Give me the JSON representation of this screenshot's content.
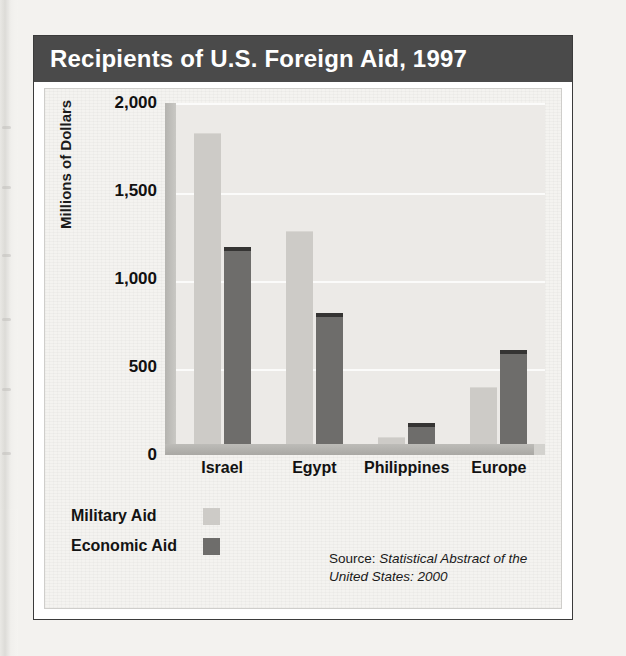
{
  "title": "Recipients of U.S. Foreign Aid, 1997",
  "legend": {
    "military_label": "Military Aid",
    "economic_label": "Economic Aid"
  },
  "source": {
    "prefix": "Source: ",
    "italic": "Statistical Abstract of the United States: 2000"
  },
  "colors": {
    "banner": "#4a4a4a",
    "panel": "#f4f3f0",
    "plot_area": "#eceae7",
    "military_bar": "#cdcbc7",
    "economic_bar": "#6e6d6b",
    "gridline": "#fbfbfa",
    "frame": "#3b3b3b"
  },
  "chart_data": {
    "type": "bar",
    "title": "Recipients of U.S. Foreign Aid, 1997",
    "xlabel": "",
    "ylabel": "Millions of Dollars",
    "categories": [
      "Israel",
      "Egypt",
      "Philippines",
      "Europe"
    ],
    "series": [
      {
        "name": "Military Aid",
        "values": [
          1830,
          1250,
          35,
          330
        ]
      },
      {
        "name": "Economic Aid",
        "values": [
          1140,
          750,
          100,
          530
        ]
      }
    ],
    "ylim": [
      0,
      2000
    ],
    "yticks": [
      0,
      500,
      1000,
      1500,
      2000
    ],
    "ytick_labels": [
      "0",
      "500",
      "1,000",
      "1,500",
      "2,000"
    ],
    "grid": true,
    "legend_position": "below-left"
  }
}
